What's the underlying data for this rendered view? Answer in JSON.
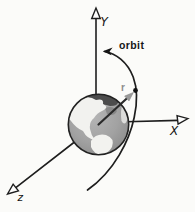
{
  "diagram": {
    "labels": {
      "y_axis": "Y",
      "x_axis": "X",
      "z_axis": "z",
      "orbit": "orbit",
      "radius": "r"
    },
    "colors": {
      "background": "#fbfbf9",
      "line": "#1e1e1e",
      "earth_ocean": "#a2a2a2",
      "earth_land_light": "#f2f2ef",
      "earth_land_dark": "#4c4c4c",
      "radius_arrow": "#9a9a9a",
      "radius_label": "#8c8c8c",
      "orbit_dot": "#111111"
    }
  }
}
